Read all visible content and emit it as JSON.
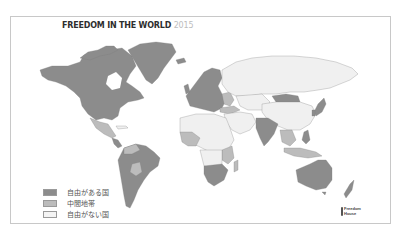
{
  "title": {
    "main": "FREEDOM IN THE WORLD",
    "year": "2015"
  },
  "colors": {
    "free": "#8c8c8c",
    "partly_free": "#bcbcbc",
    "not_free": "#f0f0f0",
    "border": "#9a9a9a",
    "frame": "#c8c8c8"
  },
  "legend": [
    {
      "label": "自由がある国",
      "status": "free",
      "color": "#8c8c8c"
    },
    {
      "label": "中間地帯",
      "status": "partly_free",
      "color": "#bcbcbc"
    },
    {
      "label": "自由がない国",
      "status": "not_free",
      "color": "#f4f4f4"
    }
  ],
  "logo": {
    "line1": "Freedom",
    "line2": "House"
  },
  "regions": [
    {
      "name": "North America (Canada/USA)",
      "status": "free"
    },
    {
      "name": "Greenland",
      "status": "free"
    },
    {
      "name": "Mexico",
      "status": "partly_free"
    },
    {
      "name": "Cuba",
      "status": "not_free"
    },
    {
      "name": "Brazil / South America",
      "status": "free"
    },
    {
      "name": "Venezuela/Bolivia/Paraguay",
      "status": "partly_free"
    },
    {
      "name": "Western Europe",
      "status": "free"
    },
    {
      "name": "Russia",
      "status": "not_free"
    },
    {
      "name": "Mongolia",
      "status": "free"
    },
    {
      "name": "China",
      "status": "not_free"
    },
    {
      "name": "India",
      "status": "free"
    },
    {
      "name": "Japan",
      "status": "free"
    },
    {
      "name": "Middle East / North Africa",
      "status": "not_free"
    },
    {
      "name": "West Africa",
      "status": "partly_free"
    },
    {
      "name": "Southern Africa",
      "status": "free"
    },
    {
      "name": "Madagascar",
      "status": "partly_free"
    },
    {
      "name": "Southeast Asia",
      "status": "partly_free"
    },
    {
      "name": "Indonesia",
      "status": "partly_free"
    },
    {
      "name": "Australia",
      "status": "free"
    },
    {
      "name": "New Zealand",
      "status": "free"
    }
  ]
}
